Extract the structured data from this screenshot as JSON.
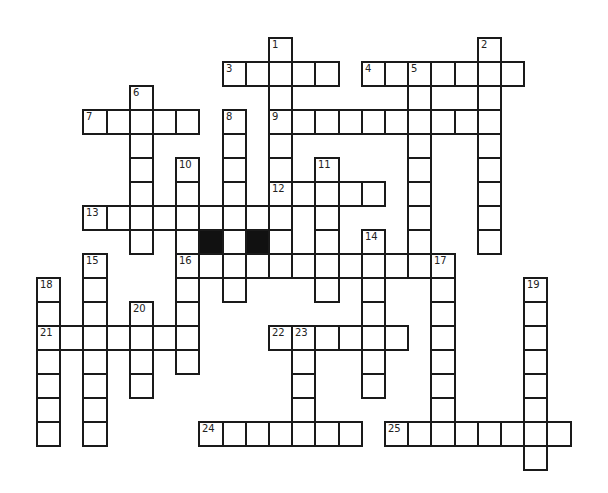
{
  "puzzle": {
    "type": "crossword",
    "grid": {
      "origin_x": 36,
      "origin_y": 37,
      "cell_w": 23.2,
      "cell_h": 24
    },
    "colors": {
      "line": "#1a1a1a",
      "block": "#111111",
      "background": "#ffffff"
    },
    "words": [
      {
        "num": "1",
        "dir": "down",
        "col": 10,
        "row": 0,
        "len": 10
      },
      {
        "num": "2",
        "dir": "down",
        "col": 19,
        "row": 0,
        "len": 9
      },
      {
        "num": "3",
        "dir": "across",
        "col": 8,
        "row": 1,
        "len": 5
      },
      {
        "num": "4",
        "dir": "across",
        "col": 14,
        "row": 1,
        "len": 7
      },
      {
        "num": "5",
        "dir": "down",
        "col": 16,
        "row": 1,
        "len": 9
      },
      {
        "num": "6",
        "dir": "down",
        "col": 4,
        "row": 2,
        "len": 7
      },
      {
        "num": "7",
        "dir": "across",
        "col": 2,
        "row": 3,
        "len": 5
      },
      {
        "num": "8",
        "dir": "down",
        "col": 8,
        "row": 3,
        "len": 8
      },
      {
        "num": "9",
        "dir": "across",
        "col": 10,
        "row": 3,
        "len": 9
      },
      {
        "num": "10",
        "dir": "down",
        "col": 6,
        "row": 5,
        "len": 9
      },
      {
        "num": "11",
        "dir": "down",
        "col": 12,
        "row": 5,
        "len": 6
      },
      {
        "num": "12",
        "dir": "across",
        "col": 10,
        "row": 6,
        "len": 5
      },
      {
        "num": "13",
        "dir": "across",
        "col": 2,
        "row": 7,
        "len": 9
      },
      {
        "num": "14",
        "dir": "down",
        "col": 14,
        "row": 8,
        "len": 7
      },
      {
        "num": "15",
        "dir": "down",
        "col": 2,
        "row": 9,
        "len": 8
      },
      {
        "num": "16",
        "dir": "across",
        "col": 6,
        "row": 9,
        "len": 11
      },
      {
        "num": "17",
        "dir": "down",
        "col": 17,
        "row": 9,
        "len": 8
      },
      {
        "num": "18",
        "dir": "down",
        "col": 0,
        "row": 10,
        "len": 7
      },
      {
        "num": "19",
        "dir": "down",
        "col": 21,
        "row": 10,
        "len": 8
      },
      {
        "num": "20",
        "dir": "down",
        "col": 4,
        "row": 11,
        "len": 4
      },
      {
        "num": "21",
        "dir": "across",
        "col": 0,
        "row": 12,
        "len": 7
      },
      {
        "num": "22",
        "dir": "across",
        "col": 10,
        "row": 12,
        "len": 6
      },
      {
        "num": "23",
        "dir": "down",
        "col": 11,
        "row": 12,
        "len": 5
      },
      {
        "num": "24",
        "dir": "across",
        "col": 7,
        "row": 16,
        "len": 7
      },
      {
        "num": "25",
        "dir": "across",
        "col": 15,
        "row": 16,
        "len": 8
      }
    ],
    "blocks": [
      {
        "col": 7,
        "row": 8
      },
      {
        "col": 9,
        "row": 8
      }
    ],
    "extra_cells": [
      {
        "col": 6,
        "row": 8
      },
      {
        "col": 8,
        "row": 8
      }
    ]
  }
}
